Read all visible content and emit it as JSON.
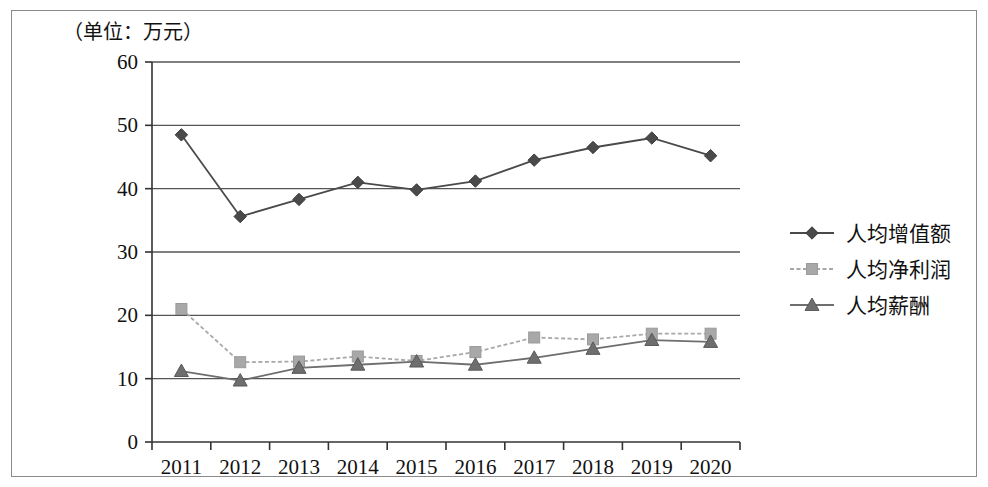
{
  "figure": {
    "unit_label": "（单位：万元）"
  },
  "chart_data": {
    "type": "line",
    "title": "",
    "subtitle": "",
    "unit_note": "（单位：万元）",
    "xlabel": "",
    "ylabel": "",
    "categories": [
      "2011",
      "2012",
      "2013",
      "2014",
      "2015",
      "2016",
      "2017",
      "2018",
      "2019",
      "2020"
    ],
    "ylim": [
      0,
      60
    ],
    "yticks": [
      0,
      10,
      20,
      30,
      40,
      50,
      60
    ],
    "grid": "horizontal",
    "legend_position": "right",
    "series": [
      {
        "name": "人均增值额",
        "marker": "diamond",
        "color": "#4a4a4a",
        "line_style": "solid",
        "values": [
          48.5,
          35.6,
          38.3,
          41.0,
          39.8,
          41.2,
          44.5,
          46.5,
          48.0,
          45.2
        ]
      },
      {
        "name": "人均净利润",
        "marker": "square",
        "color": "#a8a8a8",
        "line_style": "dashed",
        "values": [
          21.0,
          12.6,
          12.7,
          13.5,
          12.8,
          14.2,
          16.5,
          16.2,
          17.1,
          17.1
        ]
      },
      {
        "name": "人均薪酬",
        "marker": "triangle",
        "color": "#6e6e6e",
        "line_style": "solid",
        "values": [
          11.2,
          9.7,
          11.7,
          12.2,
          12.7,
          12.2,
          13.3,
          14.7,
          16.1,
          15.8
        ]
      }
    ]
  },
  "legend": {
    "items": [
      {
        "label": "人均增值额"
      },
      {
        "label": "人均净利润"
      },
      {
        "label": "人均薪酬"
      }
    ]
  },
  "axes": {
    "y_tick_labels": [
      "60",
      "50",
      "40",
      "30",
      "20",
      "10",
      "0"
    ],
    "x_tick_labels": [
      "2011",
      "2012",
      "2013",
      "2014",
      "2015",
      "2016",
      "2017",
      "2018",
      "2019",
      "2020"
    ]
  }
}
